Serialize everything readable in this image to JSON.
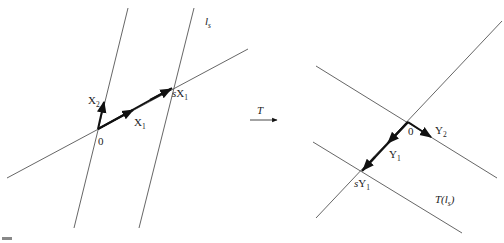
{
  "figure": {
    "left_panel": {
      "labels": {
        "line_ls": "l",
        "line_ls_sub": "s",
        "x2": "X",
        "x2_sub": "2",
        "x1": "X",
        "x1_sub": "1",
        "sx1_s": "s",
        "sx1": "X",
        "sx1_sub": "1",
        "origin": "0"
      }
    },
    "map_arrow": {
      "label": "T"
    },
    "right_panel": {
      "labels": {
        "origin": "0",
        "y2": "Y",
        "y2_sub": "2",
        "y1": "Y",
        "y1_sub": "1",
        "sy1_s": "s",
        "sy1": "Y",
        "sy1_sub": "1",
        "t_ls_prefix": "T(",
        "t_ls_l": "l",
        "t_ls_sub": "s",
        "t_ls_suffix": ")"
      }
    },
    "colors": {
      "line": "#555555",
      "vector": "#111111"
    }
  }
}
